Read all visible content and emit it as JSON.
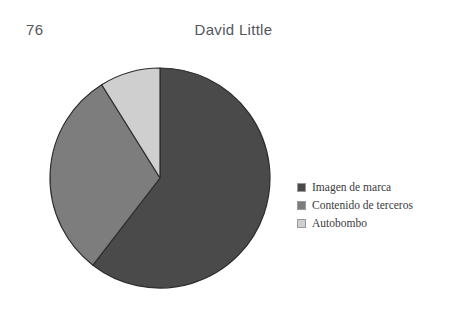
{
  "header": {
    "page_number": "76",
    "running_title": "David Little"
  },
  "colors": {
    "page_background": "#ffffff",
    "header_text": "#54565c",
    "legend_text": "#3b3b3b",
    "slice_outline": "#2e2e2e",
    "swatch_border": "#9a9a9a",
    "imagen_de_marca": "#4a4a4a",
    "contenido_de_terceros": "#7d7d7d",
    "autobombo": "#cfcfcf"
  },
  "legend": {
    "items": [
      {
        "label": "Imagen de marca",
        "color": "#4a4a4a",
        "swatch_name": "legend-swatch-imagen-de-marca"
      },
      {
        "label": "Contenido de terceros",
        "color": "#7d7d7d",
        "swatch_name": "legend-swatch-contenido-de-terceros"
      },
      {
        "label": "Autobombo",
        "color": "#cfcfcf",
        "swatch_name": "legend-swatch-autobombo"
      }
    ]
  },
  "chart_data": {
    "type": "pie",
    "title": "",
    "subtitle": "",
    "xlabel": "",
    "ylabel": "",
    "grid": false,
    "legend_position": "right",
    "start_angle_deg": 0,
    "direction": "clockwise",
    "categories": [
      "Imagen de marca",
      "Contenido de terceros",
      "Autobombo"
    ],
    "values": [
      60.4,
      30.7,
      8.9
    ],
    "units": "percent",
    "slices": [
      {
        "label": "Imagen de marca",
        "value": 60.4,
        "angle_deg": 217.6,
        "color": "#4a4a4a"
      },
      {
        "label": "Contenido de terceros",
        "value": 30.7,
        "angle_deg": 110.4,
        "color": "#7d7d7d"
      },
      {
        "label": "Autobombo",
        "value": 8.9,
        "angle_deg": 32.0,
        "color": "#cfcfcf"
      }
    ],
    "geometry": {
      "center_x": 112,
      "center_y": 112,
      "radius": 110
    }
  }
}
